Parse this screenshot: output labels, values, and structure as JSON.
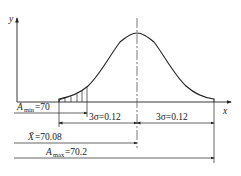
{
  "diagram": {
    "axes": {
      "x_label": "x",
      "y_label": "y"
    },
    "curve": {
      "type": "normal-distribution",
      "mean_label": "X̄"
    },
    "dimensions": {
      "a_min": {
        "symbol": "A",
        "sub": "min",
        "value": "=70"
      },
      "sigma_left": {
        "text": "3σ=0.12"
      },
      "sigma_right": {
        "text": "3σ=0.12"
      },
      "mean": {
        "symbol": "X̄",
        "value": "=70.08"
      },
      "a_max": {
        "symbol": "A",
        "sub": "max",
        "value": "=70.2"
      }
    }
  }
}
